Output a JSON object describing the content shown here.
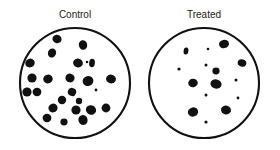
{
  "figure": {
    "title": "",
    "background_color": "#ffffff",
    "ink_color": "#111111",
    "label_color": "#1a1a1a"
  },
  "chart_data": {
    "type": "scatter",
    "title": "",
    "subtitle": "",
    "xlabel": "",
    "ylabel": "",
    "grid": false,
    "legend_position": "none",
    "xlim": [
      0,
      280
    ],
    "ylim": [
      0,
      150
    ],
    "panels": [
      {
        "id": "control",
        "label": "Control",
        "label_x": 75,
        "label_y": 15,
        "dish": {
          "cx": 75,
          "cy": 83,
          "r": 55
        },
        "colony_count": 24,
        "colonies": [
          {
            "cx": 57,
            "cy": 39,
            "rx": 4.6,
            "ry": 4.2,
            "rot": 18
          },
          {
            "cx": 83,
            "cy": 45,
            "rx": 4.2,
            "ry": 4.8,
            "rot": -12
          },
          {
            "cx": 52,
            "cy": 53,
            "rx": 4.0,
            "ry": 4.6,
            "rot": 25
          },
          {
            "cx": 30,
            "cy": 63,
            "rx": 4.8,
            "ry": 4.3,
            "rot": -20
          },
          {
            "cx": 78,
            "cy": 63,
            "rx": 4.9,
            "ry": 4.4,
            "rot": 14
          },
          {
            "cx": 92,
            "cy": 63,
            "rx": 2.9,
            "ry": 4.2,
            "rot": 6
          },
          {
            "cx": 87,
            "cy": 62,
            "rx": 1.3,
            "ry": 1.3,
            "rot": 0
          },
          {
            "cx": 32,
            "cy": 78,
            "rx": 4.6,
            "ry": 4.6,
            "rot": 0
          },
          {
            "cx": 48,
            "cy": 79,
            "rx": 4.8,
            "ry": 4.4,
            "rot": -8
          },
          {
            "cx": 70,
            "cy": 78,
            "rx": 4.6,
            "ry": 4.4,
            "rot": 10
          },
          {
            "cx": 88,
            "cy": 81,
            "rx": 5.4,
            "ry": 5.0,
            "rot": -15
          },
          {
            "cx": 111,
            "cy": 79,
            "rx": 5.0,
            "ry": 4.4,
            "rot": 12
          },
          {
            "cx": 37,
            "cy": 92,
            "rx": 4.4,
            "ry": 4.2,
            "rot": 0
          },
          {
            "cx": 72,
            "cy": 92,
            "rx": 4.2,
            "ry": 4.0,
            "rot": 20
          },
          {
            "cx": 96,
            "cy": 90,
            "rx": 1.4,
            "ry": 1.4,
            "rot": 0
          },
          {
            "cx": 27,
            "cy": 92,
            "rx": 4.6,
            "ry": 4.6,
            "rot": 0
          },
          {
            "cx": 62,
            "cy": 100,
            "rx": 4.2,
            "ry": 4.2,
            "rot": 0
          },
          {
            "cx": 79,
            "cy": 101,
            "rx": 3.2,
            "ry": 3.2,
            "rot": 0
          },
          {
            "cx": 53,
            "cy": 108,
            "rx": 4.6,
            "ry": 4.4,
            "rot": -10
          },
          {
            "cx": 76,
            "cy": 110,
            "rx": 4.6,
            "ry": 4.6,
            "rot": 0
          },
          {
            "cx": 91,
            "cy": 110,
            "rx": 5.2,
            "ry": 4.6,
            "rot": 16
          },
          {
            "cx": 106,
            "cy": 108,
            "rx": 4.4,
            "ry": 4.4,
            "rot": 0
          },
          {
            "cx": 47,
            "cy": 118,
            "rx": 4.4,
            "ry": 4.2,
            "rot": 0
          },
          {
            "cx": 64,
            "cy": 122,
            "rx": 3.6,
            "ry": 3.4,
            "rot": 0
          },
          {
            "cx": 83,
            "cy": 120,
            "rx": 4.6,
            "ry": 5.0,
            "rot": -14
          }
        ]
      },
      {
        "id": "treated",
        "label": "Treated",
        "label_x": 204,
        "label_y": 15,
        "dish": {
          "cx": 204,
          "cy": 83,
          "r": 55
        },
        "colony_count": 13,
        "colonies": [
          {
            "cx": 224,
            "cy": 44,
            "rx": 5.0,
            "ry": 4.2,
            "rot": -12
          },
          {
            "cx": 186,
            "cy": 51,
            "rx": 2.4,
            "ry": 3.6,
            "rot": 8
          },
          {
            "cx": 208,
            "cy": 49,
            "rx": 1.3,
            "ry": 1.3,
            "rot": 0
          },
          {
            "cx": 242,
            "cy": 63,
            "rx": 4.4,
            "ry": 3.6,
            "rot": 20
          },
          {
            "cx": 206,
            "cy": 65,
            "rx": 1.5,
            "ry": 1.5,
            "rot": 0
          },
          {
            "cx": 179,
            "cy": 69,
            "rx": 1.6,
            "ry": 1.6,
            "rot": 0
          },
          {
            "cx": 216,
            "cy": 71,
            "rx": 3.6,
            "ry": 3.4,
            "rot": 0
          },
          {
            "cx": 236,
            "cy": 80,
            "rx": 1.5,
            "ry": 1.5,
            "rot": 0
          },
          {
            "cx": 193,
            "cy": 83,
            "rx": 4.8,
            "ry": 4.2,
            "rot": -10
          },
          {
            "cx": 216,
            "cy": 84,
            "rx": 5.6,
            "ry": 4.6,
            "rot": 10
          },
          {
            "cx": 206,
            "cy": 95,
            "rx": 1.5,
            "ry": 1.5,
            "rot": 0
          },
          {
            "cx": 238,
            "cy": 98,
            "rx": 1.4,
            "ry": 1.4,
            "rot": 0
          },
          {
            "cx": 193,
            "cy": 112,
            "rx": 5.2,
            "ry": 4.6,
            "rot": -18
          },
          {
            "cx": 226,
            "cy": 110,
            "rx": 5.0,
            "ry": 4.4,
            "rot": 14
          },
          {
            "cx": 206,
            "cy": 122,
            "rx": 1.6,
            "ry": 1.6,
            "rot": 0
          }
        ]
      }
    ]
  }
}
